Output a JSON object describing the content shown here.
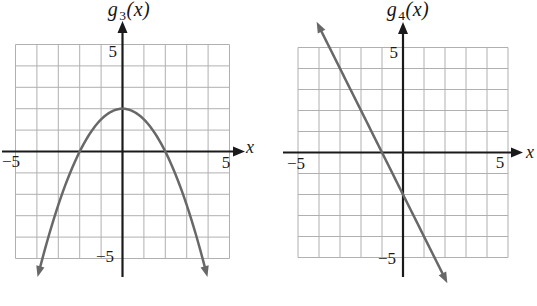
{
  "colors": {
    "background": "#ffffff",
    "curve": "#686868",
    "grid": "#b0b0b0",
    "axis": "#1a1a1a",
    "text": "#1a1a1a"
  },
  "chart_data": [
    {
      "type": "line",
      "name": "g3",
      "title": "g3(x)",
      "title_parts": {
        "func": "g",
        "sub": "3",
        "arg": "(x)"
      },
      "xlabel": "x",
      "ylabel": "g3(x)",
      "xlim": [
        -5,
        5
      ],
      "ylim": [
        -5,
        5
      ],
      "grid": true,
      "x_tick_labels": [
        "−5",
        "5"
      ],
      "y_tick_labels": [
        "5",
        "−5"
      ],
      "curve": {
        "kind": "parabola",
        "equation": "g3(x) = -0.5x^2 + 2",
        "coefficients": {
          "a": -0.5,
          "b": 0,
          "c": 2
        },
        "vertex": [
          0,
          2
        ],
        "x_intercepts": [
          -2,
          2
        ],
        "y_intercept": 2,
        "plot_domain": [
          -3.85,
          3.85
        ],
        "arrow_ends": true
      },
      "key_points": [
        [
          -2,
          0
        ],
        [
          0,
          2
        ],
        [
          2,
          0
        ]
      ]
    },
    {
      "type": "line",
      "name": "g4",
      "title": "g4(x)",
      "title_parts": {
        "func": "g",
        "sub": "4",
        "arg": "(x)"
      },
      "xlabel": "x",
      "ylabel": "g4(x)",
      "xlim": [
        -5,
        5
      ],
      "ylim": [
        -5,
        5
      ],
      "grid": true,
      "x_tick_labels": [
        "−5",
        "5"
      ],
      "y_tick_labels": [
        "5",
        "−5"
      ],
      "curve": {
        "kind": "line",
        "equation": "g4(x) = -2x - 2",
        "slope": -2,
        "y_intercept": -2,
        "x_intercept": -1,
        "plot_domain": [
          -3.9,
          1.9
        ],
        "arrow_ends": true
      },
      "key_points": [
        [
          -4,
          6
        ],
        [
          -1,
          0
        ],
        [
          0,
          -2
        ],
        [
          2,
          -6
        ]
      ]
    }
  ]
}
